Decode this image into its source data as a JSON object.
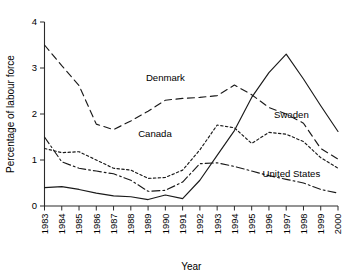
{
  "chart_data": {
    "type": "line",
    "title": "",
    "xlabel": "Year",
    "ylabel": "Percentage of labour force",
    "x": [
      1983,
      1984,
      1985,
      1986,
      1987,
      1988,
      1989,
      1990,
      1991,
      1992,
      1993,
      1994,
      1995,
      1996,
      1997,
      1998,
      1999,
      2000
    ],
    "categories": [
      "1983",
      "1984",
      "1985",
      "1986",
      "1987",
      "1988",
      "1989",
      "1990",
      "1991",
      "1992",
      "1993",
      "1994",
      "1995",
      "1996",
      "1997",
      "1998",
      "1999",
      "2000"
    ],
    "xlim": [
      1983,
      2000
    ],
    "ylim": [
      0,
      4
    ],
    "yticks": [
      0,
      1,
      2,
      3,
      4
    ],
    "ytick_labels": [
      "0",
      "1",
      "2",
      "3",
      "4"
    ],
    "grid": false,
    "legend_position": "inline-annotations",
    "series": [
      {
        "name": "Denmark",
        "style": "dashed",
        "label": "Denmark",
        "label_x": 1990.0,
        "label_y": 2.72,
        "values": [
          3.5,
          3.05,
          2.62,
          1.78,
          1.66,
          1.85,
          2.06,
          2.3,
          2.34,
          2.36,
          2.4,
          2.63,
          2.42,
          2.14,
          2.0,
          1.8,
          1.25,
          1.02
        ]
      },
      {
        "name": "Canada",
        "style": "dotted",
        "label": "Canada",
        "label_x": 1989.4,
        "label_y": 1.5,
        "values": [
          1.25,
          1.16,
          1.18,
          1.0,
          0.82,
          0.78,
          0.6,
          0.62,
          0.78,
          1.22,
          1.76,
          1.7,
          1.36,
          1.6,
          1.56,
          1.4,
          1.05,
          0.82
        ]
      },
      {
        "name": "Sweden",
        "style": "solid",
        "label": "Sweden",
        "label_x": 1997.3,
        "label_y": 1.92,
        "values": [
          0.4,
          0.42,
          0.36,
          0.28,
          0.22,
          0.2,
          0.14,
          0.24,
          0.16,
          0.56,
          1.1,
          1.64,
          2.36,
          2.9,
          3.3,
          2.76,
          2.18,
          1.62
        ]
      },
      {
        "name": "United States",
        "style": "dashdot",
        "label": "United States",
        "label_x": 1997.3,
        "label_y": 0.62,
        "values": [
          1.5,
          0.96,
          0.82,
          0.76,
          0.7,
          0.56,
          0.32,
          0.34,
          0.52,
          0.92,
          0.94,
          0.86,
          0.76,
          0.66,
          0.58,
          0.5,
          0.36,
          0.28
        ]
      }
    ]
  },
  "axis": {
    "y_label": "Percentage of labour force",
    "x_label": "Year"
  }
}
